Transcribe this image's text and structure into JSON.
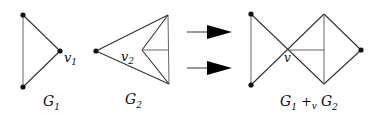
{
  "diagram": {
    "graphs": {
      "g1": {
        "label": "G",
        "label_sub": "1",
        "vertex_label": "v",
        "vertex_label_sub": "1"
      },
      "g2": {
        "label": "G",
        "label_sub": "2",
        "vertex_label": "v",
        "vertex_label_sub": "2"
      },
      "result": {
        "label": "G",
        "label_sub1": "1",
        "operator": "+",
        "operator_sub": "v",
        "label2": "G",
        "label_sub2": "2",
        "vertex_label": "v"
      }
    },
    "arrows": [
      {
        "name": "arrow-top"
      },
      {
        "name": "arrow-bottom"
      }
    ],
    "colors": {
      "edge": "#333333",
      "vertex": "#111111",
      "arrow": "#000000",
      "background": "#ffffff"
    }
  }
}
